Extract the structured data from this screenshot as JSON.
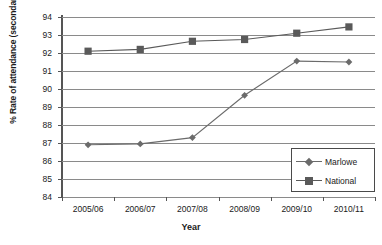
{
  "chart_data": {
    "type": "line",
    "title": "",
    "xlabel": "Year",
    "ylabel": "% Rate of attendance (secondary)",
    "categories": [
      "2005/06",
      "2006/07",
      "2007/08",
      "2008/09",
      "2009/10",
      "2010/11"
    ],
    "ylim": [
      84,
      94
    ],
    "yticks": [
      84,
      85,
      86,
      87,
      88,
      89,
      90,
      91,
      92,
      93,
      94
    ],
    "grid": true,
    "legend_position": "bottom-right",
    "series": [
      {
        "name": "Marlowe",
        "marker": "diamond",
        "color": "#6b6b6b",
        "values": [
          86.9,
          86.95,
          87.3,
          89.65,
          91.55,
          91.5
        ]
      },
      {
        "name": "National",
        "marker": "square",
        "color": "#5a5a5a",
        "values": [
          92.1,
          92.2,
          92.65,
          92.75,
          93.1,
          93.45
        ]
      }
    ]
  },
  "colors": {
    "axis": "#555555",
    "grid": "#8a8a8a",
    "marlowe": "#6b6b6b",
    "national": "#5a5a5a",
    "legend_border": "#4a4a4a",
    "text": "#1a1a1a",
    "background": "#ffffff"
  }
}
